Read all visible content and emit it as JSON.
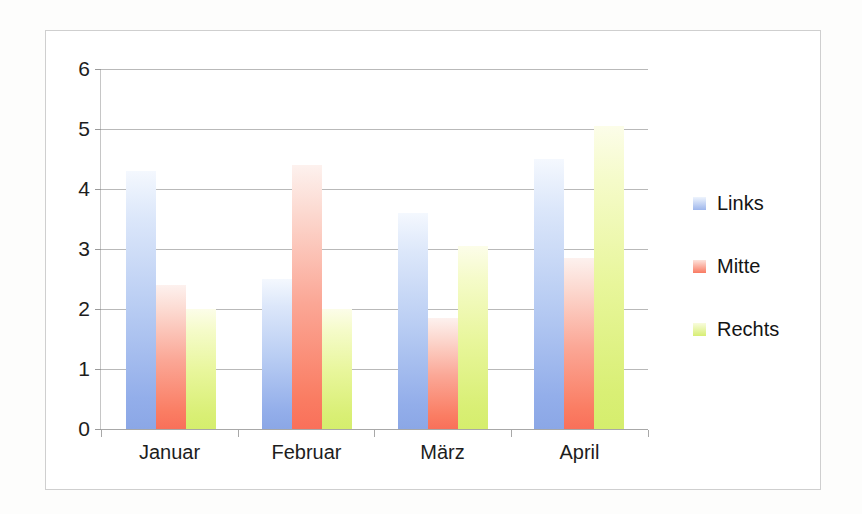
{
  "chart_data": {
    "type": "bar",
    "title": "",
    "xlabel": "",
    "ylabel": "",
    "categories": [
      "Januar",
      "Februar",
      "März",
      "April"
    ],
    "series": [
      {
        "name": "Links",
        "color": "#8ba7e6",
        "values": [
          4.3,
          2.5,
          3.6,
          4.5
        ]
      },
      {
        "name": "Mitte",
        "color": "#f9705a",
        "values": [
          2.4,
          4.4,
          1.85,
          2.85
        ]
      },
      {
        "name": "Rechts",
        "color": "#d5ee6d",
        "values": [
          2.0,
          2.0,
          3.05,
          5.05
        ]
      }
    ],
    "ylim": [
      0,
      6
    ],
    "ytick_labels": [
      "0",
      "1",
      "2",
      "3",
      "4",
      "5",
      "6"
    ],
    "ytick_values": [
      0,
      1,
      2,
      3,
      4,
      5,
      6
    ],
    "grid": true,
    "legend_position": "right",
    "legend_entries": [
      "Links",
      "Mitte",
      "Rechts"
    ]
  },
  "axes": {
    "y_labels": [
      "6",
      "5",
      "4",
      "3",
      "2",
      "1",
      "0"
    ],
    "x_labels": [
      "Januar",
      "Februar",
      "März",
      "April"
    ]
  },
  "legend": {
    "items": [
      {
        "label": "Links"
      },
      {
        "label": "Mitte"
      },
      {
        "label": "Rechts"
      }
    ]
  }
}
